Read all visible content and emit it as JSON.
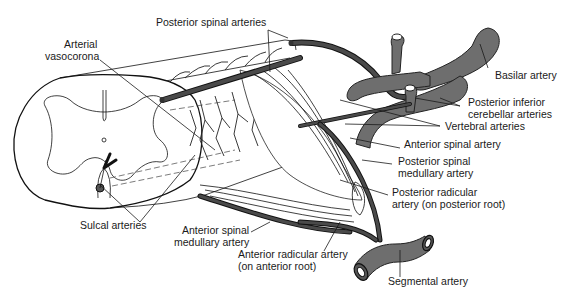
{
  "figure": {
    "colors": {
      "artery_fill": "#6e6e6e",
      "outline": "#111111",
      "background": "#ffffff"
    }
  },
  "labels": {
    "posterior_spinal_arteries": "Posterior spinal arteries",
    "arterial_vasocorona_1": "Arterial",
    "arterial_vasocorona_2": "vasocorona",
    "basilar_artery": "Basilar artery",
    "pica_1": "Posterior inferior",
    "pica_2": "cerebellar arteries",
    "vertebral_arteries": "Vertebral arteries",
    "anterior_spinal_artery": "Anterior spinal artery",
    "posterior_spinal_medullary_1": "Posterior spinal",
    "posterior_spinal_medullary_2": "medullary artery",
    "posterior_radicular_1": "Posterior radicular",
    "posterior_radicular_2": "artery (on posterior root)",
    "sulcal_arteries": "Sulcal arteries",
    "anterior_spinal_medullary_1": "Anterior spinal",
    "anterior_spinal_medullary_2": "medullary artery",
    "anterior_radicular_1": "Anterior radicular artery",
    "anterior_radicular_2": "(on anterior root)",
    "segmental_artery": "Segmental artery"
  }
}
